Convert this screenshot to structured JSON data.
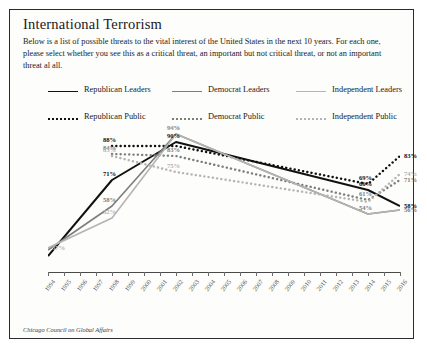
{
  "title": "International Terrorism",
  "blurb": "Below is a list of possible threats to the vital interest of the United States in the next 10 years. For each one, please select whether you see this as a critical threat, an important but not critical threat, or not an important threat al all.",
  "source": "Chicago Council on Global Affairs",
  "legend": [
    {
      "label": "Republican Leaders",
      "style": "solid",
      "color": "#111111"
    },
    {
      "label": "Democrat Leaders",
      "style": "solid",
      "color": "#7d7d7d"
    },
    {
      "label": "Independent Leaders",
      "style": "solid",
      "color": "#b4b4b4"
    },
    {
      "label": "Republican Public",
      "style": "dotted",
      "color": "#111111"
    },
    {
      "label": "Democrat Public",
      "style": "dotted",
      "color": "#7d7d7d"
    },
    {
      "label": "Independent Public",
      "style": "dotted",
      "color": "#b4b4b4"
    }
  ],
  "chart_data": {
    "type": "line",
    "title": "International Terrorism",
    "xlabel": "",
    "ylabel": "Percent (%) Critical Threat",
    "ylim": [
      25,
      100
    ],
    "grid": false,
    "legend_position": "top",
    "x": [
      1994,
      1995,
      1996,
      1997,
      1998,
      1999,
      2000,
      2001,
      2002,
      2003,
      2004,
      2005,
      2006,
      2007,
      2008,
      2009,
      2010,
      2011,
      2012,
      2013,
      2014,
      2015,
      2016
    ],
    "categories": [
      "1994",
      "1995",
      "1996",
      "1997",
      "1998",
      "1999",
      "2000",
      "2001",
      "2002",
      "2003",
      "2004",
      "2005",
      "2006",
      "2007",
      "2008",
      "2009",
      "2010",
      "2011",
      "2012",
      "2013",
      "2014",
      "2015",
      "2016"
    ],
    "series": [
      {
        "name": "Republican Leaders",
        "color": "#111111",
        "style": "solid",
        "x": [
          1994,
          1998,
          2002,
          2014,
          2016
        ],
        "values": [
          33,
          71,
          90,
          66,
          58
        ],
        "labels": [
          {
            "x": 1998,
            "y": 71,
            "text": "71%"
          },
          {
            "x": 2002,
            "y": 90,
            "text": "90%"
          },
          {
            "x": 2014,
            "y": 66,
            "text": "66%"
          },
          {
            "x": 2016,
            "y": 58,
            "text": "58%"
          }
        ]
      },
      {
        "name": "Republican Public",
        "color": "#111111",
        "style": "dotted",
        "x": [
          1998,
          2002,
          2014,
          2016
        ],
        "values": [
          88,
          88,
          69,
          83
        ],
        "labels": [
          {
            "x": 1998,
            "y": 88,
            "text": "88%"
          },
          {
            "x": 2014,
            "y": 69,
            "text": "69%"
          },
          {
            "x": 2016,
            "y": 83,
            "text": "83%"
          }
        ]
      },
      {
        "name": "Democrat Leaders",
        "color": "#7d7d7d",
        "style": "solid",
        "x": [
          1994,
          1998,
          2002,
          2014,
          2016
        ],
        "values": [
          36,
          58,
          94,
          54,
          56
        ],
        "labels": [
          {
            "x": 1998,
            "y": 58,
            "text": "58%"
          },
          {
            "x": 2002,
            "y": 94,
            "text": "94%"
          },
          {
            "x": 2014,
            "y": 54,
            "text": "54%"
          },
          {
            "x": 2016,
            "y": 56,
            "text": "56%"
          }
        ]
      },
      {
        "name": "Democrat Public",
        "color": "#7d7d7d",
        "style": "dotted",
        "x": [
          1998,
          2002,
          2014,
          2016
        ],
        "values": [
          84,
          83,
          61,
          71
        ],
        "labels": [
          {
            "x": 1998,
            "y": 84,
            "text": "84%"
          },
          {
            "x": 2002,
            "y": 83,
            "text": "83%"
          },
          {
            "x": 2014,
            "y": 61,
            "text": "61%"
          },
          {
            "x": 2016,
            "y": 71,
            "text": "71%"
          }
        ]
      },
      {
        "name": "Independent Leaders",
        "color": "#b4b4b4",
        "style": "solid",
        "x": [
          1994,
          1998,
          2002,
          2014,
          2016
        ],
        "values": [
          37,
          52,
          94,
          54,
          56
        ],
        "labels": [
          {
            "x": 1994,
            "y": 37,
            "text": "37%"
          },
          {
            "x": 1998,
            "y": 52,
            "text": "52%"
          },
          {
            "x": 2002,
            "y": 94,
            "text": "94%"
          }
        ]
      },
      {
        "name": "Independent Public",
        "color": "#b4b4b4",
        "style": "dotted",
        "x": [
          1998,
          2002,
          2014,
          2016
        ],
        "values": [
          83,
          75,
          60,
          74
        ],
        "labels": [
          {
            "x": 1998,
            "y": 83,
            "text": "83%"
          },
          {
            "x": 2002,
            "y": 75,
            "text": "75%"
          },
          {
            "x": 2016,
            "y": 74,
            "text": "74%"
          }
        ]
      }
    ]
  }
}
